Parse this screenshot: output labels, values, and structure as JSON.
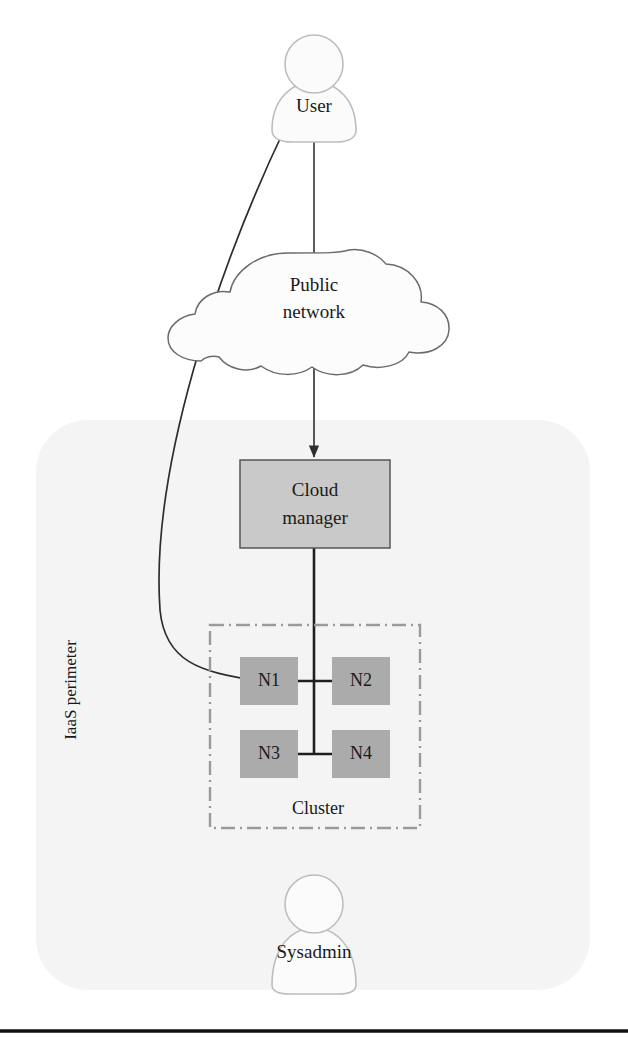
{
  "diagram": {
    "actors": {
      "user": {
        "label": "User",
        "icon": "person-icon"
      },
      "sysadmin": {
        "label": "Sysadmin",
        "icon": "person-icon"
      }
    },
    "cloud": {
      "label_line1": "Public",
      "label_line2": "network",
      "icon": "cloud-icon"
    },
    "cloud_manager": {
      "label_line1": "Cloud",
      "label_line2": "manager"
    },
    "perimeter": {
      "label": "IaaS perimeter"
    },
    "cluster": {
      "label": "Cluster",
      "nodes": [
        {
          "id": "n1",
          "label": "N1"
        },
        {
          "id": "n2",
          "label": "N2"
        },
        {
          "id": "n3",
          "label": "N3"
        },
        {
          "id": "n4",
          "label": "N4"
        }
      ]
    },
    "connections": [
      {
        "from": "User",
        "to": "Public network",
        "style": "line"
      },
      {
        "from": "Public network",
        "to": "Cloud manager",
        "style": "arrow"
      },
      {
        "from": "User",
        "to": "N1",
        "style": "curved-arrow"
      },
      {
        "from": "Cloud manager",
        "to": "Cluster",
        "style": "line"
      },
      {
        "from": "N1",
        "to": "N2",
        "style": "line"
      },
      {
        "from": "N3",
        "to": "N4",
        "style": "line"
      }
    ]
  },
  "colors": {
    "perimeter_fill": "#f4f4f4",
    "box_fill": "#c9c9c9",
    "box_stroke": "#555555",
    "node_fill": "#ababab",
    "cluster_stroke": "#9a9a9a",
    "actor_fill": "#fbfbfb",
    "actor_stroke": "#b8b8b8",
    "line": "#333333",
    "rule": "#111111",
    "text": "#1a1a1a"
  }
}
